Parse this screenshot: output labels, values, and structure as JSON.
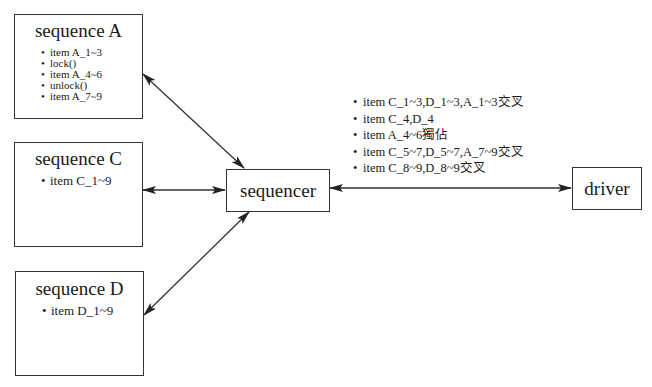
{
  "diagram": {
    "sequence_a": {
      "title": "sequence A",
      "items": [
        "item A_1~3",
        "lock()",
        "item A_4~6",
        "unlock()",
        "item A_7~9"
      ]
    },
    "sequence_c": {
      "title": "sequence C",
      "items": [
        "item C_1~9"
      ]
    },
    "sequence_d": {
      "title": "sequence D",
      "items": [
        "item D_1~9"
      ]
    },
    "sequencer": {
      "label": "sequencer"
    },
    "driver": {
      "label": "driver"
    },
    "sequencer_driver_note": {
      "items": [
        "item C_1~3,D_1~3,A_1~3交叉",
        "item C_4,D_4",
        "item A_4~6獨佔",
        "item C_5~7,D_5~7,A_7~9交叉",
        "item C_8~9,D_8~9交叉"
      ]
    },
    "edges": [
      {
        "from": "sequence A",
        "to": "sequencer",
        "type": "bidirectional"
      },
      {
        "from": "sequence C",
        "to": "sequencer",
        "type": "bidirectional"
      },
      {
        "from": "sequence D",
        "to": "sequencer",
        "type": "bidirectional"
      },
      {
        "from": "sequencer",
        "to": "driver",
        "type": "bidirectional"
      }
    ],
    "colors": {
      "stroke": "#333333",
      "background": "#ffffff",
      "text": "#1a1a1a"
    }
  }
}
